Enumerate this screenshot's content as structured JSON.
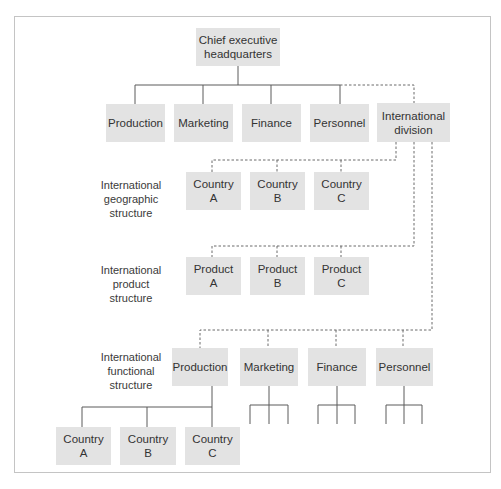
{
  "diagram": {
    "type": "organization-chart",
    "colors": {
      "box_fill": "#e3e3e3",
      "line": "#5a5a5a",
      "frame": "#c4c4c4"
    },
    "root": {
      "label": "Chief executive\nheadquarters"
    },
    "domestic_functions": [
      {
        "label": "Production"
      },
      {
        "label": "Marketing"
      },
      {
        "label": "Finance"
      },
      {
        "label": "Personnel"
      }
    ],
    "international_division": {
      "label": "International\ndivision"
    },
    "structures": {
      "geographic": {
        "label": "International\ngeographic\nstructure",
        "units": [
          {
            "label": "Country\nA"
          },
          {
            "label": "Country\nB"
          },
          {
            "label": "Country\nC"
          }
        ]
      },
      "product": {
        "label": "International\nproduct\nstructure",
        "units": [
          {
            "label": "Product\nA"
          },
          {
            "label": "Product\nB"
          },
          {
            "label": "Product\nC"
          }
        ]
      },
      "functional": {
        "label": "International\nfunctional\nstructure",
        "units": [
          {
            "label": "Production"
          },
          {
            "label": "Marketing"
          },
          {
            "label": "Finance"
          },
          {
            "label": "Personnel"
          }
        ],
        "production_subunits": [
          {
            "label": "Country\nA"
          },
          {
            "label": "Country\nB"
          },
          {
            "label": "Country\nC"
          }
        ]
      }
    },
    "legend": {
      "solid_line": "direct reporting",
      "dashed_line": "international division links"
    }
  }
}
